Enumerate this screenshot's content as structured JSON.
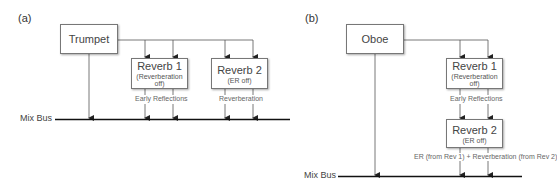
{
  "panel_a": {
    "label": "(a)",
    "source": "Trumpet",
    "reverb1": {
      "title": "Reverb 1",
      "sub": "(Reverberation off)"
    },
    "reverb2": {
      "title": "Reverb 2",
      "sub": "(ER off)"
    },
    "label_er": "Early Reflections",
    "label_rev": "Reverberation",
    "bus": "Mix Bus"
  },
  "panel_b": {
    "label": "(b)",
    "source": "Oboe",
    "reverb1": {
      "title": "Reverb 1",
      "sub": "(Reverberation off)"
    },
    "reverb2": {
      "title": "Reverb 2",
      "sub": "(ER off)"
    },
    "label_er": "Early Reflections",
    "label_out": "ER (from Rev 1) + Reverberation (from Rev 2)",
    "bus": "Mix Bus"
  }
}
